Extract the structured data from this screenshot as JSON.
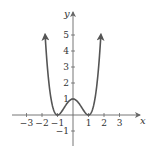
{
  "chart_data": {
    "type": "line",
    "title": "",
    "function": "y = (x^2 - 1)^2",
    "xlabel": "x",
    "ylabel": "y",
    "xlim": [
      -3.6,
      4.0
    ],
    "ylim": [
      -1.6,
      6.3
    ],
    "x_ticks": [
      -3,
      -2,
      -1,
      1,
      2,
      3
    ],
    "x_tick_labels": [
      "−3",
      "−2",
      "−1",
      "1",
      "2",
      "3"
    ],
    "y_ticks": [
      -1,
      1,
      2,
      3,
      4,
      5
    ],
    "y_tick_labels": [
      "−1",
      "1",
      "2",
      "3",
      "4",
      "5"
    ],
    "grid": false,
    "legend": null,
    "series": [
      {
        "name": "f(x)",
        "color": "#555555",
        "x": [
          -1.8,
          -1.6,
          -1.4,
          -1.2,
          -1.0,
          -0.8,
          -0.6,
          -0.4,
          -0.2,
          0.0,
          0.2,
          0.4,
          0.6,
          0.8,
          1.0,
          1.2,
          1.4,
          1.6,
          1.8
        ],
        "y": [
          5.02,
          2.43,
          0.92,
          0.19,
          0.0,
          0.13,
          0.41,
          0.71,
          0.92,
          1.0,
          0.92,
          0.71,
          0.41,
          0.13,
          0.0,
          0.19,
          0.92,
          2.43,
          5.02
        ],
        "end_arrows": true
      }
    ],
    "key_points": [
      {
        "x": -1,
        "y": 0,
        "note": "local minimum"
      },
      {
        "x": 0,
        "y": 1,
        "note": "local maximum"
      },
      {
        "x": 1,
        "y": 0,
        "note": "local minimum"
      }
    ]
  },
  "axes": {
    "x_label": "x",
    "y_label": "y"
  },
  "colors": {
    "curve": "#555555",
    "axis": "#666666",
    "text": "#333333",
    "background": "#ffffff"
  }
}
